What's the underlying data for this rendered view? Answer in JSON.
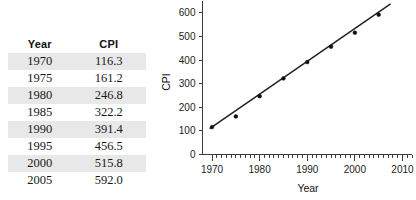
{
  "table": {
    "headers": [
      "Year",
      "CPI"
    ],
    "rows": [
      {
        "year": "1970",
        "cpi": "116.3"
      },
      {
        "year": "1975",
        "cpi": "161.2"
      },
      {
        "year": "1980",
        "cpi": "246.8"
      },
      {
        "year": "1985",
        "cpi": "322.2"
      },
      {
        "year": "1990",
        "cpi": "391.4"
      },
      {
        "year": "1995",
        "cpi": "456.5"
      },
      {
        "year": "2000",
        "cpi": "515.8"
      },
      {
        "year": "2005",
        "cpi": "592.0"
      }
    ]
  },
  "chart_data": {
    "type": "scatter",
    "title": "",
    "xlabel": "Year",
    "ylabel": "CPI",
    "x": [
      1970,
      1975,
      1980,
      1985,
      1990,
      1995,
      2000,
      2005
    ],
    "values": [
      116.3,
      161.2,
      246.8,
      322.2,
      391.4,
      456.5,
      515.8,
      592.0
    ],
    "series": [
      {
        "name": "CPI",
        "x": [
          1970,
          1975,
          1980,
          1985,
          1990,
          1995,
          2000,
          2005
        ],
        "values": [
          116.3,
          161.2,
          246.8,
          322.2,
          391.4,
          456.5,
          515.8,
          592.0
        ]
      }
    ],
    "trendline": {
      "type": "linear-fit",
      "x_start": 1969.5,
      "y_start": 110,
      "x_end": 2007.5,
      "y_end": 638
    },
    "xlim": [
      1968,
      2012
    ],
    "ylim": [
      0,
      650
    ],
    "xticks": [
      1970,
      1980,
      1990,
      2000,
      2010
    ],
    "xticklabels": [
      "1970",
      "1980",
      "1990",
      "2000",
      "2010"
    ],
    "xminortick_step": 1,
    "yticks": [
      0,
      100,
      200,
      300,
      400,
      500,
      600
    ],
    "yticklabels": [
      "0",
      "100",
      "200",
      "300",
      "400",
      "500",
      "600"
    ],
    "grid": false,
    "legend": false,
    "marker_color": "#111111",
    "line_color": "#222222"
  }
}
